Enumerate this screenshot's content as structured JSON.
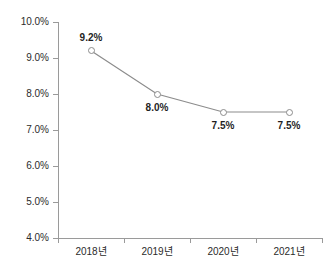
{
  "chart_data": {
    "type": "line",
    "title": "",
    "xlabel": "",
    "ylabel": "",
    "categories": [
      "2018년",
      "2019년",
      "2020년",
      "2021년"
    ],
    "values": [
      9.2,
      8.0,
      7.5,
      7.5
    ],
    "data_labels": [
      "9.2%",
      "8.0%",
      "7.5%",
      "7.5%"
    ],
    "label_positions": [
      "above",
      "below",
      "below",
      "below"
    ],
    "ylim": [
      4.0,
      10.0
    ],
    "ytick_values": [
      4.0,
      5.0,
      6.0,
      7.0,
      8.0,
      9.0,
      10.0
    ],
    "ytick_labels": [
      "4.0%",
      "5.0%",
      "6.0%",
      "7.0%",
      "8.0%",
      "9.0%",
      "10.0%"
    ],
    "grid": false,
    "legend": "none",
    "series": [
      {
        "name": "",
        "values": [
          9.2,
          8.0,
          7.5,
          7.5
        ]
      }
    ],
    "colors": {
      "line": "#8c8c8c",
      "marker_fill": "#ffffff",
      "marker_stroke": "#8c8c8c",
      "axis": "#9a9a9a",
      "tick_label": "#2b2b2b",
      "data_label": "#1f1f1f",
      "background": "#ffffff"
    }
  }
}
